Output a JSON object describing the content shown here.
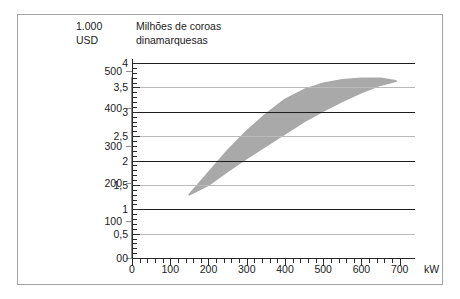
{
  "figure": {
    "unit_left_line1": "1.000",
    "unit_left_line2": "USD",
    "unit_right_line1": "Milhões de coroas",
    "unit_right_line2": "dinamarquesas",
    "x_axis_unit": "kW",
    "band_color": "#a9a9a9",
    "gridline_major_color": "#1c1c1c",
    "gridline_minor_color": "#b9bbbd",
    "frame_color": "#a3a6a8"
  },
  "chart_data": {
    "type": "area",
    "title": "",
    "subtitle": "",
    "xlabel": "kW",
    "ylabel": "Milhões de coroas dinamarquesas",
    "ylabel_secondary": "1.000 USD",
    "xlim": [
      0,
      740
    ],
    "ylim": [
      0,
      4
    ],
    "ylim_secondary": [
      0,
      520
    ],
    "grid": true,
    "legend": "none",
    "x_ticks": [
      0,
      100,
      200,
      300,
      400,
      500,
      600,
      700
    ],
    "x_tick_labels": [
      "0",
      "100",
      "200",
      "300",
      "400",
      "500",
      "600",
      "700"
    ],
    "x_minor_tick_step": 20,
    "y_ticks": [
      0,
      0.5,
      1,
      1.5,
      2,
      2.5,
      3,
      3.5,
      4
    ],
    "y_tick_labels": [
      "0",
      "0,5",
      "1",
      "1,5",
      "2",
      "2,5",
      "3",
      "3,5",
      "4"
    ],
    "y_minor_tick_step": 0.1,
    "y_ticks_secondary": [
      0,
      100,
      200,
      300,
      400,
      500
    ],
    "y_tick_labels_secondary": [
      "0",
      "100",
      "200",
      "300",
      "400",
      "500"
    ],
    "series": [
      {
        "name": "Faixa de custo de investimento",
        "type": "band",
        "upper": [
          {
            "x": 150,
            "y": 1.3
          },
          {
            "x": 200,
            "y": 1.75
          },
          {
            "x": 250,
            "y": 2.2
          },
          {
            "x": 300,
            "y": 2.6
          },
          {
            "x": 350,
            "y": 2.95
          },
          {
            "x": 400,
            "y": 3.25
          },
          {
            "x": 450,
            "y": 3.45
          },
          {
            "x": 500,
            "y": 3.58
          },
          {
            "x": 550,
            "y": 3.65
          },
          {
            "x": 600,
            "y": 3.68
          },
          {
            "x": 650,
            "y": 3.68
          },
          {
            "x": 690,
            "y": 3.63
          }
        ],
        "lower": [
          {
            "x": 150,
            "y": 1.3
          },
          {
            "x": 200,
            "y": 1.5
          },
          {
            "x": 250,
            "y": 1.78
          },
          {
            "x": 300,
            "y": 2.05
          },
          {
            "x": 350,
            "y": 2.3
          },
          {
            "x": 400,
            "y": 2.55
          },
          {
            "x": 450,
            "y": 2.8
          },
          {
            "x": 500,
            "y": 3.02
          },
          {
            "x": 550,
            "y": 3.22
          },
          {
            "x": 600,
            "y": 3.4
          },
          {
            "x": 650,
            "y": 3.55
          },
          {
            "x": 690,
            "y": 3.63
          }
        ]
      }
    ],
    "annotations": []
  }
}
